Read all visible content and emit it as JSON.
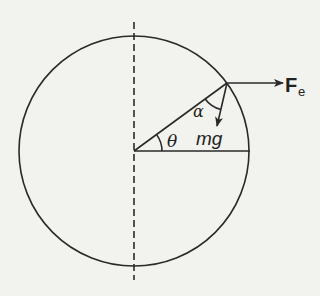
{
  "diagram": {
    "title": "",
    "labels": {
      "force_electric": "F",
      "force_electric_subscript": "e",
      "weight": "mg",
      "angle_theta": "θ",
      "angle_alpha": "α"
    },
    "colors": {
      "ink": "#2a2a2a",
      "paper": "#f2f2ef"
    },
    "elements": [
      "circle",
      "vertical-dashed-axis",
      "horizontal-radius",
      "inclined-radius",
      "electric-force-arrow",
      "weight-arrow",
      "theta-arc",
      "alpha-arc"
    ]
  }
}
